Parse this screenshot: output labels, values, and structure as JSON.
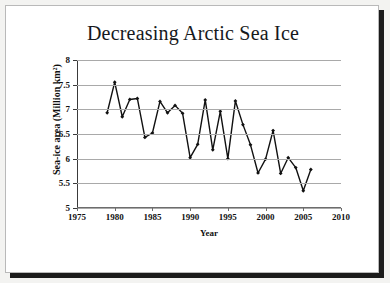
{
  "page": {
    "background_color": "#f3f3f1",
    "sheet_color": "#ffffff",
    "shadow_color": "#1b1b1b"
  },
  "chart_data": {
    "type": "line",
    "title": "Decreasing Arctic Sea Ice",
    "xlabel": "Year",
    "ylabel": "Sea-ice area (Million km²)",
    "xlim": [
      1975,
      2010
    ],
    "ylim": [
      5,
      8
    ],
    "xticks": [
      1975,
      1980,
      1985,
      1990,
      1995,
      2000,
      2005,
      2010
    ],
    "xtick_labels": [
      "1975",
      "1980",
      "1985",
      "1990",
      "1995",
      "2000",
      "2005",
      "2010"
    ],
    "yticks": [
      5,
      5.5,
      6,
      6.5,
      7,
      7.5,
      8
    ],
    "ytick_labels": [
      "5",
      "5.5",
      "6",
      "6.5",
      "7",
      "7.5",
      "8"
    ],
    "grid": "horizontal",
    "legend": "none",
    "line_color": "#111111",
    "marker": "diamond",
    "marker_color": "#111111",
    "x": [
      1979,
      1980,
      1981,
      1982,
      1983,
      1984,
      1985,
      1986,
      1987,
      1988,
      1989,
      1990,
      1991,
      1992,
      1993,
      1994,
      1995,
      1996,
      1997,
      1998,
      1999,
      2000,
      2001,
      2002,
      2003,
      2004,
      2005,
      2006
    ],
    "values": [
      6.93,
      7.55,
      6.85,
      7.2,
      7.22,
      6.43,
      6.52,
      7.16,
      6.93,
      7.08,
      6.92,
      6.02,
      6.29,
      7.19,
      6.18,
      6.96,
      6.0,
      7.17,
      6.69,
      6.28,
      5.71,
      5.99,
      6.57,
      5.7,
      6.02,
      5.82,
      5.35,
      5.78
    ],
    "series_name": "Arctic sea-ice area"
  }
}
